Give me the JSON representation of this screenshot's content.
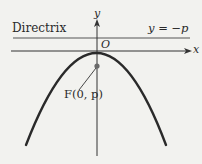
{
  "diagram": {
    "type": "parabola-focus-directrix",
    "labels": {
      "directrix": "Directrix",
      "directrix_equation": "y = −p",
      "origin": "O",
      "x_axis": "x",
      "y_axis": "y",
      "focus": "F(0, p)"
    },
    "colors": {
      "background": "#f2f2ef",
      "stroke": "#2a2a2a",
      "thin_line": "#555555",
      "focus_dot": "#6a6a6a"
    },
    "geometry": {
      "vertex": [
        97,
        53
      ],
      "focus": [
        97,
        66
      ],
      "directrix_y": 38,
      "x_axis_y": 51,
      "y_axis_x": 97,
      "parabola_left_end": [
        26,
        145
      ],
      "parabola_right_end": [
        166,
        145
      ]
    }
  }
}
